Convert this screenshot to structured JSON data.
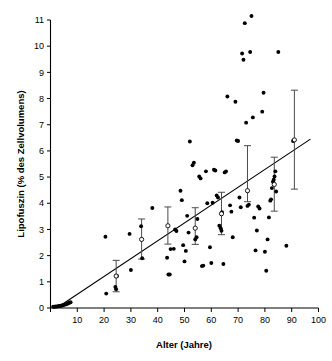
{
  "chart_data": {
    "type": "scatter",
    "title": "",
    "xlabel": "Alter (Jahre)",
    "ylabel": "Lipofuszin (% des Zellvolumens)",
    "xlim": [
      0,
      100
    ],
    "ylim": [
      0,
      11
    ],
    "grid": false,
    "legend": null,
    "xticks": [
      0,
      10,
      20,
      30,
      40,
      50,
      60,
      70,
      80,
      90,
      100
    ],
    "xtick_labels": [
      "",
      "10",
      "20",
      "30",
      "40",
      "50",
      "60",
      "70",
      "80",
      "90",
      "100"
    ],
    "yticks": [
      0,
      1,
      2,
      3,
      4,
      5,
      6,
      7,
      8,
      9,
      10,
      11
    ],
    "ytick_labels": [
      "0",
      "1",
      "2",
      "3",
      "4",
      "5",
      "6",
      "7",
      "8",
      "9",
      "10",
      "11"
    ],
    "series": [
      {
        "name": "Einzelmessungen",
        "marker": "filled-circle",
        "points": [
          [
            1.0,
            0.05
          ],
          [
            1.5,
            0.05
          ],
          [
            2.0,
            0.06
          ],
          [
            2.5,
            0.06
          ],
          [
            3.0,
            0.07
          ],
          [
            3.3,
            0.08
          ],
          [
            3.6,
            0.08
          ],
          [
            4.0,
            0.09
          ],
          [
            4.3,
            0.1
          ],
          [
            4.6,
            0.1
          ],
          [
            5.0,
            0.12
          ],
          [
            5.4,
            0.13
          ],
          [
            5.8,
            0.14
          ],
          [
            6.2,
            0.16
          ],
          [
            6.6,
            0.18
          ],
          [
            7.0,
            0.2
          ],
          [
            7.5,
            0.22
          ],
          [
            20.5,
            2.72
          ],
          [
            20.8,
            0.55
          ],
          [
            24.2,
            0.8
          ],
          [
            24.5,
            0.72
          ],
          [
            24.8,
            1.22
          ],
          [
            29.5,
            2.83
          ],
          [
            30.0,
            1.45
          ],
          [
            33.8,
            3.12
          ],
          [
            34.2,
            1.9
          ],
          [
            38.0,
            3.82
          ],
          [
            43.5,
            1.92
          ],
          [
            44.0,
            1.28
          ],
          [
            44.5,
            1.28
          ],
          [
            44.8,
            2.25
          ],
          [
            46.0,
            2.26
          ],
          [
            46.5,
            3.0
          ],
          [
            47.0,
            2.94
          ],
          [
            48.5,
            4.48
          ],
          [
            49.0,
            4.12
          ],
          [
            49.5,
            2.4
          ],
          [
            50.0,
            1.78
          ],
          [
            50.5,
            2.18
          ],
          [
            51.0,
            3.52
          ],
          [
            51.5,
            2.88
          ],
          [
            52.0,
            6.36
          ],
          [
            53.0,
            5.45
          ],
          [
            53.5,
            5.55
          ],
          [
            54.0,
            2.62
          ],
          [
            54.5,
            2.7
          ],
          [
            54.8,
            3.4
          ],
          [
            55.5,
            5.02
          ],
          [
            56.0,
            4.95
          ],
          [
            56.5,
            1.6
          ],
          [
            57.0,
            1.62
          ],
          [
            58.0,
            5.22
          ],
          [
            58.5,
            4.0
          ],
          [
            59.5,
            2.32
          ],
          [
            60.0,
            1.72
          ],
          [
            60.5,
            4.02
          ],
          [
            61.0,
            5.28
          ],
          [
            61.5,
            5.25
          ],
          [
            62.0,
            4.3
          ],
          [
            62.5,
            4.22
          ],
          [
            63.0,
            3.14
          ],
          [
            63.5,
            3.05
          ],
          [
            63.8,
            2.95
          ],
          [
            64.0,
            3.66
          ],
          [
            64.5,
            1.68
          ],
          [
            65.0,
            5.18
          ],
          [
            65.5,
            5.22
          ],
          [
            66.0,
            8.08
          ],
          [
            67.0,
            3.92
          ],
          [
            67.5,
            3.68
          ],
          [
            68.0,
            2.7
          ],
          [
            69.0,
            7.88
          ],
          [
            69.5,
            6.4
          ],
          [
            70.0,
            6.38
          ],
          [
            70.5,
            4.22
          ],
          [
            71.0,
            3.85
          ],
          [
            71.5,
            9.72
          ],
          [
            72.0,
            9.48
          ],
          [
            72.5,
            10.88
          ],
          [
            73.0,
            7.08
          ],
          [
            73.5,
            3.9
          ],
          [
            74.0,
            3.95
          ],
          [
            74.5,
            9.78
          ],
          [
            75.0,
            11.15
          ],
          [
            75.5,
            7.28
          ],
          [
            76.0,
            3.45
          ],
          [
            76.5,
            2.2
          ],
          [
            77.0,
            2.96
          ],
          [
            77.5,
            3.88
          ],
          [
            78.0,
            3.8
          ],
          [
            79.0,
            7.5
          ],
          [
            79.5,
            8.22
          ],
          [
            80.0,
            2.15
          ],
          [
            80.5,
            1.42
          ],
          [
            81.0,
            2.62
          ],
          [
            81.5,
            3.46
          ],
          [
            82.0,
            4.1
          ],
          [
            82.3,
            4.15
          ],
          [
            82.6,
            4.58
          ],
          [
            83.0,
            4.82
          ],
          [
            83.3,
            4.9
          ],
          [
            83.6,
            5.02
          ],
          [
            83.9,
            5.22
          ],
          [
            84.2,
            4.45
          ],
          [
            85.0,
            9.78
          ],
          [
            88.0,
            2.38
          ],
          [
            90.5,
            6.38
          ]
        ]
      },
      {
        "name": "Mittelwerte mit Standardabweichung",
        "marker": "open-circle",
        "points": [
          {
            "x": 24.5,
            "y": 1.22,
            "err_low": 0.6,
            "err_high": 0.6
          },
          {
            "x": 34.0,
            "y": 2.62,
            "err_low": 0.75,
            "err_high": 0.78
          },
          {
            "x": 43.8,
            "y": 3.14,
            "err_low": 0.7,
            "err_high": 0.72
          },
          {
            "x": 54.0,
            "y": 3.05,
            "err_low": 0.62,
            "err_high": 0.78
          },
          {
            "x": 63.8,
            "y": 3.6,
            "err_low": 0.8,
            "err_high": 0.82
          },
          {
            "x": 73.5,
            "y": 4.48,
            "err_low": 0.42,
            "err_high": 1.72
          },
          {
            "x": 83.5,
            "y": 4.72,
            "err_low": 1.02,
            "err_high": 1.04
          },
          {
            "x": 91.0,
            "y": 6.42,
            "err_low": 1.88,
            "err_high": 1.9
          }
        ]
      }
    ],
    "regression_line": {
      "name": "Regressionsgerade",
      "x_start": 3.0,
      "y_start": 0.05,
      "x_end": 97.0,
      "y_end": 6.45
    }
  }
}
